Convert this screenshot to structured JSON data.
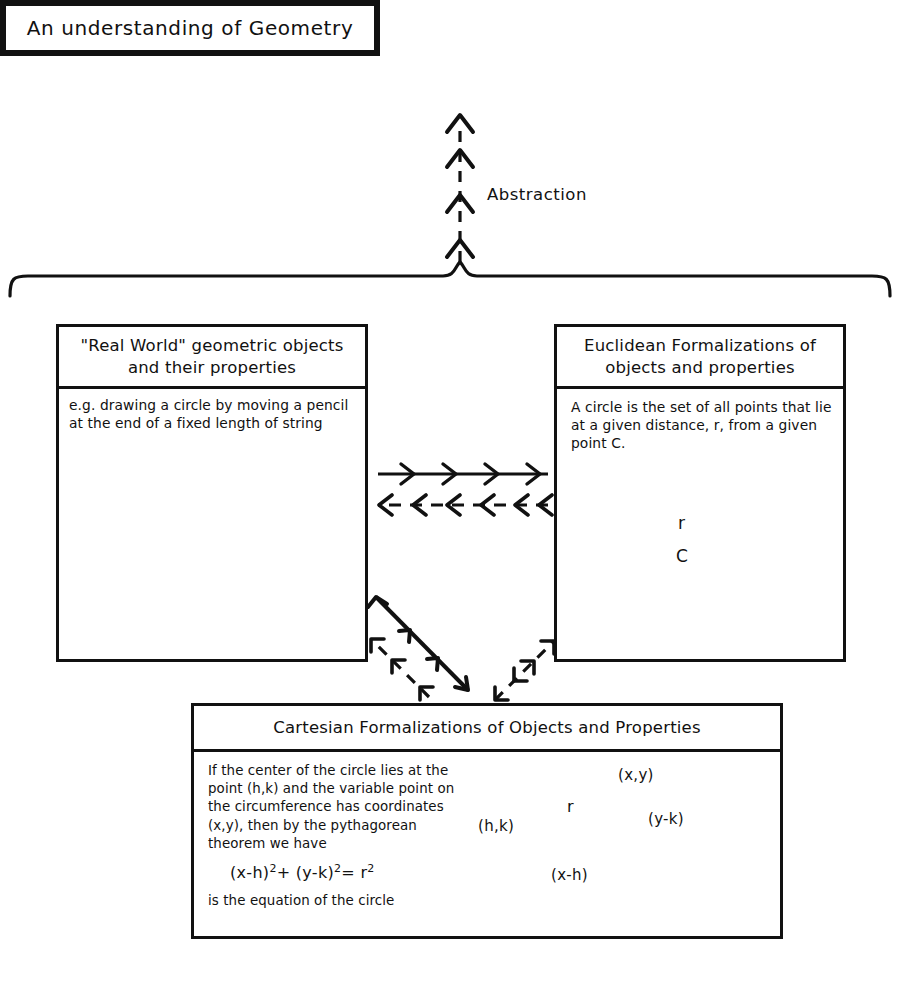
{
  "title_box": {
    "text": "An understanding of Geometry"
  },
  "abstraction": {
    "label": "Abstraction"
  },
  "real_world_box": {
    "title": "\"Real World\" geometric objects and their properties",
    "body": "e.g. drawing a circle by moving a pencil at the end of a fixed length of string",
    "figure": {
      "name": "hand-drawn-circle-with-radius",
      "center_mark": "x"
    }
  },
  "euclidean_box": {
    "title": "Euclidean Formalizations of objects and properties",
    "body": "A circle is the set of all points that lie at a given distance, r, from a given point C.",
    "figure": {
      "name": "circle-with-center-and-radius",
      "center_label": "C",
      "radius_label": "r"
    }
  },
  "cartesian_box": {
    "title": "Cartesian Formalizations of Objects and Properties",
    "body": "If the center of the circle lies at the point (h,k) and the variable point on the circumference has coordinates (x,y), then by the pythagorean theorem we have",
    "equation_left": "(x-h)",
    "equation_exp1": "2",
    "equation_plus": "+",
    "equation_mid": "(y-k)",
    "equation_exp2": "2",
    "equation_eq": "=",
    "equation_r": "r",
    "equation_exp3": "2",
    "body_tail": "is the equation of the circle",
    "figure": {
      "name": "circle-with-right-triangle",
      "center_label": "(h,k)",
      "point_label": "(x,y)",
      "radius_label": "r",
      "horizontal_label": "(x-h)",
      "vertical_label": "(y-k)"
    }
  },
  "connectors": {
    "abstraction_arrow": "dashed-up-arrow-with-chevrons",
    "brace": "horizontal-curly-brace",
    "real_to_euclid": "solid-right-arrow-with-chevrons",
    "euclid_to_real": "dashed-left-arrow-with-chevrons",
    "real_to_cartesian": "solid-down-right-arrow-with-chevrons",
    "cartesian_to_real": "dashed-up-left-arrow-with-chevrons",
    "euclid_cartesian": "dashed-double-headed-diagonal-arrow"
  },
  "colors": {
    "ink": "#111111",
    "paper": "#ffffff"
  }
}
